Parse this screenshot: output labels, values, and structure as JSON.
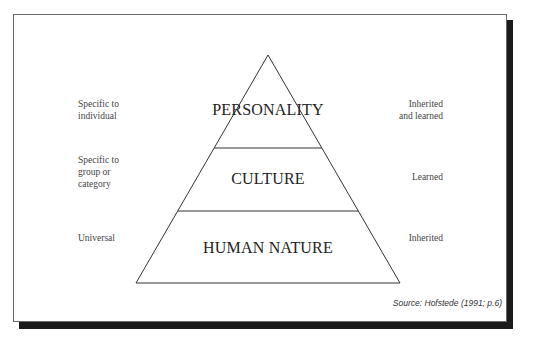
{
  "diagram": {
    "type": "pyramid",
    "tiers": [
      {
        "label": "PERSONALITY",
        "left_note": [
          "Specific to",
          "individual"
        ],
        "right_note": [
          "Inherited",
          "and learned"
        ]
      },
      {
        "label": "CULTURE",
        "left_note": [
          "Specific to",
          "group or",
          "category"
        ],
        "right_note": [
          "Learned"
        ]
      },
      {
        "label": "HUMAN NATURE",
        "left_note": [
          "Universal"
        ],
        "right_note": [
          "Inherited"
        ]
      }
    ],
    "source": "Source: Hofstede (1991; p.6)"
  },
  "colors": {
    "line": "#333333",
    "shadow": "#1a1a1a",
    "text": "#2b2b2b"
  }
}
